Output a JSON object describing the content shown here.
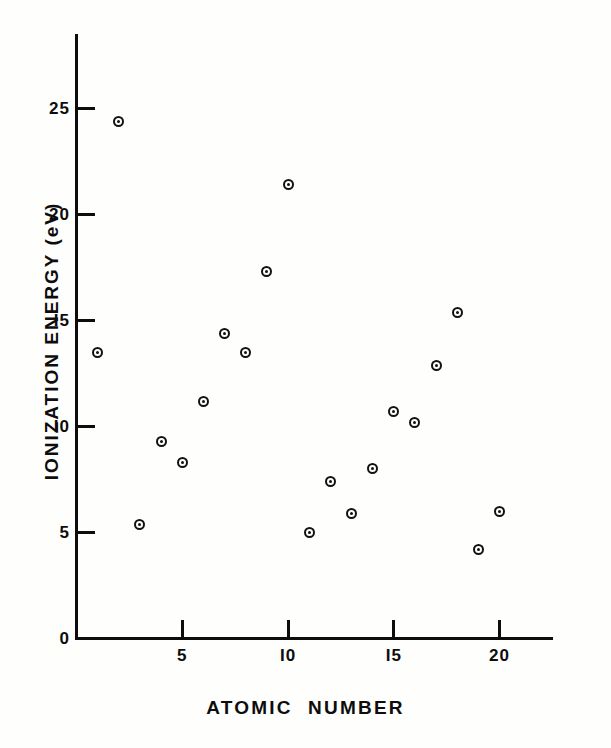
{
  "chart_data": {
    "type": "scatter",
    "title": "",
    "xlabel": "ATOMIC   NUMBER",
    "ylabel": "IONIZATION ENERGY (eV)",
    "xlim": [
      0,
      22.6
    ],
    "ylim": [
      0,
      28.6
    ],
    "grid": false,
    "legend": null,
    "marker": "circle-with-center-dot",
    "marker_color": "#121212",
    "xticks": [
      5,
      10,
      15,
      20
    ],
    "xticklabels": [
      "5",
      "I0",
      "I5",
      "20"
    ],
    "yticks": [
      0,
      5,
      10,
      15,
      20,
      25
    ],
    "yticklabels": [
      "0",
      "5",
      "I0",
      "I5",
      "20",
      "25"
    ],
    "x": [
      1,
      2,
      3,
      4,
      5,
      6,
      7,
      8,
      9,
      10,
      11,
      12,
      13,
      14,
      15,
      16,
      17,
      18,
      19,
      20
    ],
    "y": [
      13.5,
      24.4,
      5.4,
      9.3,
      8.3,
      11.2,
      14.4,
      13.5,
      17.3,
      21.4,
      5.0,
      7.4,
      5.9,
      8.0,
      10.7,
      10.2,
      12.9,
      15.4,
      4.2,
      6.0
    ],
    "points": [
      {
        "x": 1,
        "y": 13.5
      },
      {
        "x": 2,
        "y": 24.4
      },
      {
        "x": 3,
        "y": 5.4
      },
      {
        "x": 4,
        "y": 9.3
      },
      {
        "x": 5,
        "y": 8.3
      },
      {
        "x": 6,
        "y": 11.2
      },
      {
        "x": 7,
        "y": 14.4
      },
      {
        "x": 8,
        "y": 13.5
      },
      {
        "x": 9,
        "y": 17.3
      },
      {
        "x": 10,
        "y": 21.4
      },
      {
        "x": 11,
        "y": 5.0
      },
      {
        "x": 12,
        "y": 7.4
      },
      {
        "x": 13,
        "y": 5.9
      },
      {
        "x": 14,
        "y": 8.0
      },
      {
        "x": 15,
        "y": 10.7
      },
      {
        "x": 16,
        "y": 10.2
      },
      {
        "x": 17,
        "y": 12.9
      },
      {
        "x": 18,
        "y": 15.4
      },
      {
        "x": 19,
        "y": 4.2
      },
      {
        "x": 20,
        "y": 6.0
      }
    ]
  },
  "colors": {
    "ink": "#0d0d0d",
    "paper": "#fefefd"
  }
}
